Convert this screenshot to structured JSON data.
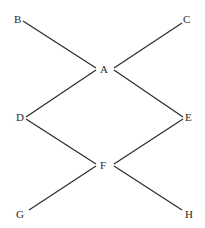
{
  "diagram": {
    "type": "graph",
    "nodes": [
      {
        "id": "B",
        "label": "B",
        "x": 18,
        "y": 20
      },
      {
        "id": "C",
        "label": "C",
        "x": 187,
        "y": 20
      },
      {
        "id": "A",
        "label": "A",
        "x": 104,
        "y": 69
      },
      {
        "id": "D",
        "label": "D",
        "x": 20,
        "y": 117
      },
      {
        "id": "E",
        "label": "E",
        "x": 189,
        "y": 117
      },
      {
        "id": "F",
        "label": "F",
        "x": 104,
        "y": 165
      },
      {
        "id": "G",
        "label": "G",
        "x": 20,
        "y": 214
      },
      {
        "id": "H",
        "label": "H",
        "x": 189,
        "y": 214
      }
    ],
    "edges": [
      {
        "from": "B",
        "to": "A"
      },
      {
        "from": "C",
        "to": "A"
      },
      {
        "from": "A",
        "to": "D"
      },
      {
        "from": "A",
        "to": "E"
      },
      {
        "from": "D",
        "to": "F"
      },
      {
        "from": "E",
        "to": "F"
      },
      {
        "from": "F",
        "to": "G"
      },
      {
        "from": "F",
        "to": "H"
      }
    ],
    "colors": {
      "line": "#2a2a2a",
      "text": "#2a2a2a",
      "background": "#ffffff"
    }
  }
}
